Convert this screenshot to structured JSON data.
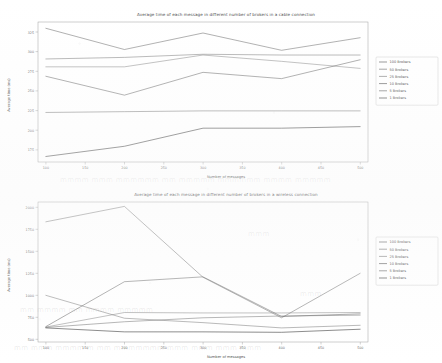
{
  "document": {
    "kind": "scanned-figure-page",
    "background_color": "#ffffff",
    "ink_color": "#4d4d4d"
  },
  "charts": [
    {
      "id": "cable",
      "title": "Average time of each message in different number of brokers in a cable connection",
      "xlabel": "Number of messages",
      "ylabel": "Average time (ms)"
    },
    {
      "id": "wireless",
      "title": "Average time of each message in different number of brokers in a wireless connection",
      "xlabel": "Number of messages",
      "ylabel": "Average time (ms)"
    }
  ],
  "legend": {
    "entries": [
      {
        "label": "100 Brokers",
        "color": "#5a5a5a"
      },
      {
        "label": "50 Brokers",
        "color": "#6b6b6b"
      },
      {
        "label": "25 Brokers",
        "color": "#7a7a7a"
      },
      {
        "label": "10 Brokers",
        "color": "#545454"
      },
      {
        "label": "5 Brokers",
        "color": "#636363"
      },
      {
        "label": "1 Brokers",
        "color": "#3f3f3f"
      }
    ]
  },
  "chart_data": [
    {
      "type": "line",
      "id": "cable",
      "title": "Average time of each message in different number of brokers in a cable connection",
      "xlabel": "Number of messages",
      "ylabel": "Average time (ms)",
      "x": [
        100,
        200,
        300,
        400,
        500
      ],
      "xticks": [
        100,
        150,
        200,
        250,
        300,
        350,
        400,
        450,
        500
      ],
      "yticks": [
        175,
        200,
        225,
        250,
        275,
        300,
        325
      ],
      "xlim": [
        90,
        510
      ],
      "ylim": [
        160,
        338
      ],
      "grid": false,
      "legend_position": "right-outside",
      "series": [
        {
          "name": "100 Brokers",
          "color": "#5a5a5a",
          "values": [
            330,
            303,
            324,
            302,
            318
          ]
        },
        {
          "name": "50 Brokers",
          "color": "#6b6b6b",
          "values": [
            291,
            293,
            297,
            296,
            296
          ]
        },
        {
          "name": "25 Brokers",
          "color": "#7a7a7a",
          "values": [
            281,
            281,
            296,
            288,
            279
          ]
        },
        {
          "name": "10 Brokers",
          "color": "#545454",
          "values": [
            269,
            245,
            274,
            266,
            290
          ]
        },
        {
          "name": "5 Brokers",
          "color": "#636363",
          "values": [
            223,
            224,
            225,
            225,
            225
          ]
        },
        {
          "name": "1 Brokers",
          "color": "#3f3f3f",
          "values": [
            167,
            180,
            203,
            203,
            205
          ]
        }
      ]
    },
    {
      "type": "line",
      "id": "wireless",
      "title": "Average time of each message in different number of brokers in a wireless connection",
      "xlabel": "Number of messages",
      "ylabel": "Average time (ms)",
      "x": [
        100,
        200,
        300,
        400,
        500
      ],
      "xticks": [
        100,
        150,
        200,
        250,
        300,
        350,
        400,
        450,
        500
      ],
      "yticks": [
        500,
        750,
        1000,
        1250,
        1500,
        1750,
        2000
      ],
      "xlim": [
        90,
        510
      ],
      "ylim": [
        470,
        2060
      ],
      "grid": false,
      "legend_position": "right-outside",
      "series": [
        {
          "name": "100 Brokers",
          "color": "#5a5a5a",
          "values": [
            1835,
            2010,
            1205,
            745,
            1250
          ]
        },
        {
          "name": "50 Brokers",
          "color": "#6b6b6b",
          "values": [
            1000,
            740,
            690,
            630,
            660
          ]
        },
        {
          "name": "25 Brokers",
          "color": "#7a7a7a",
          "values": [
            640,
            805,
            800,
            800,
            805
          ]
        },
        {
          "name": "10 Brokers",
          "color": "#545454",
          "values": [
            645,
            1155,
            1210,
            760,
            790
          ]
        },
        {
          "name": "5 Brokers",
          "color": "#636363",
          "values": [
            635,
            700,
            745,
            765,
            775
          ]
        },
        {
          "name": "1 Brokers",
          "color": "#3f3f3f",
          "values": [
            630,
            585,
            585,
            580,
            615
          ]
        }
      ]
    }
  ]
}
